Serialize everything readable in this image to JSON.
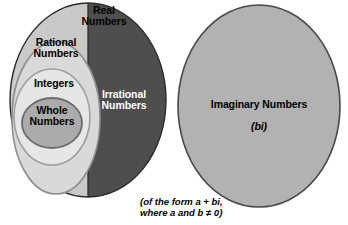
{
  "diagram": {
    "type": "venn-set-diagram",
    "regions": {
      "real": {
        "label": "Real\nNumbers",
        "fill_light": "#c9c9c9",
        "fill_dark": "#4e4e4e",
        "stroke": "#2b2b2b"
      },
      "rational": {
        "label": "Rational\nNumbers",
        "fill": "#d6d6d6",
        "stroke": "#8a8a8a"
      },
      "integers": {
        "label": "Integers",
        "fill": "#e4e4e4",
        "stroke": "#9a9a9a"
      },
      "whole": {
        "label": "Whole\nNumbers",
        "fill": "#ababab",
        "stroke": "#6e6e6e"
      },
      "irrational": {
        "label": "Irrational\nNumbers",
        "fill": "#4e4e4e",
        "text_color": "#ffffff"
      },
      "imaginary": {
        "label": "Imaginary Numbers",
        "sub_label": "(bi)",
        "fill": "#b0b0b0",
        "stroke": "#4a4a4a"
      }
    },
    "caption_line_1": "(of the form a + bi,",
    "caption_line_2": "where a and b ≠ 0)"
  }
}
